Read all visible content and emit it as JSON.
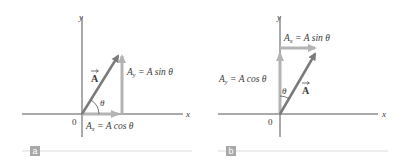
{
  "figure": {
    "panels": [
      {
        "id": "a",
        "tag": "a",
        "axes": {
          "x_label": "x",
          "y_label": "y",
          "origin_label": "0"
        },
        "vector_label": "A",
        "angle_label": "θ",
        "angle_reference": "x-axis",
        "components": {
          "x": {
            "label_main": "A",
            "label_sub": "x",
            "label_rest": " = A cos θ"
          },
          "y": {
            "label_main": "A",
            "label_sub": "y",
            "label_rest": " = A sin θ"
          }
        }
      },
      {
        "id": "b",
        "tag": "b",
        "axes": {
          "x_label": "x",
          "y_label": "y",
          "origin_label": "0"
        },
        "vector_label": "A",
        "angle_label": "θ",
        "angle_reference": "y-axis",
        "components": {
          "x": {
            "label_main": "A",
            "label_sub": "x",
            "label_rest": " = A sin θ"
          },
          "y": {
            "label_main": "A",
            "label_sub": "y",
            "label_rest": " = A cos θ"
          }
        }
      }
    ],
    "colors": {
      "axis": "#555555",
      "vector": "#7a7a7a",
      "component": "#b4b4b4",
      "tag_bg": "#a8a8a8",
      "tag_line": "#dcdcdc",
      "text": "#3a3a3a"
    }
  }
}
